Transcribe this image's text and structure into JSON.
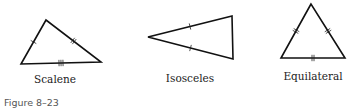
{
  "figure": {
    "caption": "Figure 8–23",
    "triangles": [
      {
        "id": "scalene",
        "label": "Scalene",
        "vertices": [
          [
            46,
            20
          ],
          [
            21,
            64
          ],
          [
            101,
            62
          ]
        ],
        "side_ticks": [
          1,
          2,
          3
        ],
        "label_pos": [
          55,
          83
        ]
      },
      {
        "id": "isosceles",
        "label": "Isosceles",
        "vertices": [
          [
            148,
            37
          ],
          [
            232,
            16
          ],
          [
            233,
            59
          ]
        ],
        "side_ticks": [
          1,
          0,
          1
        ],
        "label_pos": [
          190,
          82
        ]
      },
      {
        "id": "equilateral",
        "label": "Equilateral",
        "vertices": [
          [
            311,
            4
          ],
          [
            281,
            58
          ],
          [
            345,
            58
          ]
        ],
        "side_ticks": [
          2,
          2,
          2
        ],
        "label_pos": [
          313,
          80
        ]
      }
    ],
    "colors": {
      "stroke": "#111111",
      "text": "#222222",
      "caption": "#555555"
    }
  }
}
